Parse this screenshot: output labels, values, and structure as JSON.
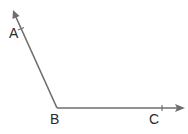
{
  "diagram": {
    "type": "angle",
    "name": "angle ABC",
    "colors": {
      "line": "#6e6e6e",
      "text": "#2a2a2a",
      "background": "#ffffff"
    },
    "points": {
      "A": {
        "label": "A",
        "x": 21,
        "y": 29
      },
      "B": {
        "label": "B",
        "x": 57,
        "y": 108
      },
      "C": {
        "label": "C",
        "x": 162,
        "y": 108
      }
    },
    "rays": [
      {
        "name": "ray BA",
        "from": "B",
        "through": "A",
        "arrow": true
      },
      {
        "name": "ray BC",
        "from": "B",
        "through": "C",
        "arrow": true
      }
    ]
  }
}
